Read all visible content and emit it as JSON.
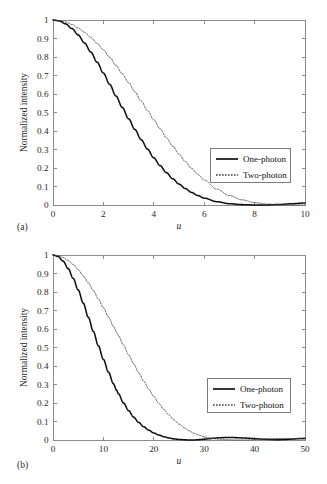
{
  "figure": {
    "panels": [
      {
        "id": "a",
        "panel_label": "(a)",
        "xlabel": "u",
        "ylabel": "Normalized intensity",
        "xlim": [
          0,
          10
        ],
        "ylim": [
          0,
          1
        ],
        "xticks": [
          0,
          2,
          4,
          6,
          8,
          10
        ],
        "xticklabels": [
          "0",
          "2",
          "4",
          "6",
          "8",
          "10"
        ],
        "yticks": [
          0,
          0.1,
          0.2,
          0.3,
          0.4,
          0.5,
          0.6,
          0.7,
          0.8,
          0.9,
          1
        ],
        "yticklabels": [
          "0",
          "0.1",
          "0.2",
          "0.3",
          "0.4",
          "0.5",
          "0.6",
          "0.7",
          "0.8",
          "0.9",
          "1"
        ],
        "legend": [
          {
            "label": "One-photon",
            "style": "solid"
          },
          {
            "label": "Two-photon",
            "style": "dotted"
          }
        ]
      },
      {
        "id": "b",
        "panel_label": "(b)",
        "xlabel": "u",
        "ylabel": "Normalized intensity",
        "xlim": [
          0,
          50
        ],
        "ylim": [
          0,
          1
        ],
        "xticks": [
          0,
          10,
          20,
          30,
          40,
          50
        ],
        "xticklabels": [
          "0",
          "10",
          "20",
          "30",
          "40",
          "50"
        ],
        "yticks": [
          0,
          0.1,
          0.2,
          0.3,
          0.4,
          0.5,
          0.6,
          0.7,
          0.8,
          0.9,
          1
        ],
        "yticklabels": [
          "0",
          "0.1",
          "0.2",
          "0.3",
          "0.4",
          "0.5",
          "0.6",
          "0.7",
          "0.8",
          "0.9",
          "1"
        ],
        "legend": [
          {
            "label": "One-photon",
            "style": "solid"
          },
          {
            "label": "Two-photon",
            "style": "dotted"
          }
        ]
      }
    ]
  },
  "chart_data": [
    {
      "type": "line",
      "panel": "a",
      "title": "",
      "xlabel": "u",
      "ylabel": "Normalized intensity",
      "xlim": [
        0,
        10
      ],
      "ylim": [
        0,
        1
      ],
      "grid": false,
      "legend_position": "right",
      "x": [
        0,
        0.25,
        0.5,
        0.75,
        1,
        1.25,
        1.5,
        1.75,
        2,
        2.25,
        2.5,
        2.75,
        3,
        3.25,
        3.5,
        3.75,
        4,
        4.25,
        4.5,
        4.75,
        5,
        5.25,
        5.5,
        5.75,
        6,
        6.5,
        7,
        7.5,
        8,
        8.5,
        9,
        9.5,
        10
      ],
      "series": [
        {
          "name": "One-photon",
          "style": "solid",
          "values": [
            1,
            0.995,
            0.979,
            0.954,
            0.919,
            0.876,
            0.827,
            0.772,
            0.713,
            0.652,
            0.589,
            0.527,
            0.466,
            0.408,
            0.353,
            0.302,
            0.255,
            0.213,
            0.175,
            0.142,
            0.113,
            0.089,
            0.068,
            0.051,
            0.037,
            0.018,
            0.007,
            0.002,
            0.0003,
            0.0005,
            0.003,
            0.007,
            0.011
          ]
        },
        {
          "name": "Two-photon",
          "style": "dotted",
          "values": [
            1,
            0.997,
            0.989,
            0.976,
            0.957,
            0.934,
            0.906,
            0.874,
            0.838,
            0.798,
            0.755,
            0.709,
            0.661,
            0.612,
            0.562,
            0.511,
            0.461,
            0.412,
            0.364,
            0.318,
            0.275,
            0.235,
            0.198,
            0.165,
            0.135,
            0.086,
            0.051,
            0.028,
            0.013,
            0.005,
            0.001,
            0.0001,
            0.0003
          ]
        }
      ]
    },
    {
      "type": "line",
      "panel": "b",
      "title": "",
      "xlabel": "u",
      "ylabel": "Normalized intensity",
      "xlim": [
        0,
        50
      ],
      "ylim": [
        0,
        1
      ],
      "grid": false,
      "legend_position": "right",
      "x": [
        0,
        1,
        2,
        3,
        4,
        5,
        6,
        7,
        8,
        9,
        10,
        11,
        12,
        12.6,
        13,
        14,
        15,
        16,
        17,
        18,
        19,
        20,
        21,
        22,
        23,
        24,
        25,
        25.2,
        26,
        27,
        28,
        29,
        30,
        31,
        32,
        33,
        34,
        35,
        36,
        37,
        37.7,
        38,
        39,
        40,
        41,
        42,
        43,
        44,
        45,
        46,
        47,
        48,
        49,
        50
      ],
      "series": [
        {
          "name": "One-photon",
          "style": "solid",
          "values": [
            1,
            0.992,
            0.967,
            0.927,
            0.874,
            0.811,
            0.74,
            0.664,
            0.587,
            0.51,
            0.436,
            0.367,
            0.304,
            0.27,
            0.249,
            0.2,
            0.159,
            0.124,
            0.095,
            0.072,
            0.053,
            0.038,
            0.027,
            0.018,
            0.011,
            0.006,
            0.003,
            0.003,
            0.001,
            0.0001,
            0.0003,
            0.002,
            0.004,
            0.007,
            0.01,
            0.012,
            0.013,
            0.014,
            0.013,
            0.012,
            0.011,
            0.011,
            0.009,
            0.007,
            0.005,
            0.004,
            0.003,
            0.002,
            0.002,
            0.003,
            0.004,
            0.006,
            0.008,
            0.009
          ]
        },
        {
          "name": "Two-photon",
          "style": "dotted",
          "values": [
            1,
            0.997,
            0.987,
            0.971,
            0.949,
            0.921,
            0.888,
            0.85,
            0.808,
            0.763,
            0.715,
            0.665,
            0.614,
            0.584,
            0.563,
            0.512,
            0.461,
            0.412,
            0.364,
            0.318,
            0.275,
            0.235,
            0.198,
            0.165,
            0.135,
            0.109,
            0.086,
            0.084,
            0.066,
            0.05,
            0.036,
            0.026,
            0.018,
            0.011,
            0.007,
            0.004,
            0.002,
            0.001,
            0.0003,
            0.0001,
            0.0001,
            0.0002,
            0.001,
            0.002,
            0.003,
            0.005,
            0.006,
            0.007,
            0.008,
            0.008,
            0.008,
            0.007,
            0.006,
            0.005
          ]
        }
      ]
    }
  ]
}
